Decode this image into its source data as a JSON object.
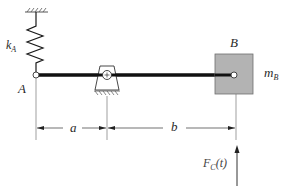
{
  "diagram": {
    "type": "mechanical-system",
    "colors": {
      "line": "#1a1a1a",
      "thin_line": "#555555",
      "mass_fill": "#b3b3b3",
      "mass_border": "#6e6e6e",
      "hatch": "#555555",
      "text": "#2a2a2a"
    },
    "labels": {
      "spring": "k",
      "spring_sub": "A",
      "point_a": "A",
      "point_b": "B",
      "mass": "m",
      "mass_sub": "B",
      "dim_a": "a",
      "dim_b": "b",
      "force": "F",
      "force_sub": "C",
      "force_arg": "(t)"
    },
    "components": [
      {
        "name": "ground-support-top",
        "kind": "fixed-wall"
      },
      {
        "name": "spring-kA",
        "kind": "spring",
        "connects": [
          "ground-support-top",
          "A"
        ]
      },
      {
        "name": "bar",
        "kind": "rigid-bar",
        "from": "A",
        "to": "B"
      },
      {
        "name": "pivot",
        "kind": "pin-support",
        "position": "a from A"
      },
      {
        "name": "mass-mB",
        "kind": "block-mass",
        "at": "B"
      },
      {
        "name": "force-Fc",
        "kind": "applied-force",
        "direction": "up",
        "at": "B"
      }
    ],
    "dimensions": [
      {
        "label": "a",
        "from": "A",
        "to": "pivot"
      },
      {
        "label": "b",
        "from": "pivot",
        "to": "B"
      }
    ]
  }
}
